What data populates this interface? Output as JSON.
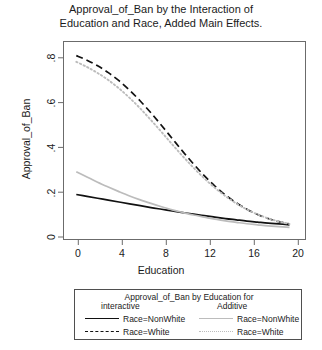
{
  "chart_data": {
    "type": "line",
    "title": "Approval_of_Ban by the Interaction of Education and Race, Added Main Effects.",
    "title_lines": [
      "Approval_of_Ban by the Interaction of",
      "Education and Race, Added Main Effects."
    ],
    "xlabel": "Education",
    "ylabel": "Approval_of_Ban",
    "xlim": [
      -1.2,
      21.5
    ],
    "ylim": [
      -0.035,
      0.92
    ],
    "xticks": [
      0,
      4,
      8,
      12,
      16,
      20
    ],
    "xtick_labels": [
      "0",
      "4",
      "8",
      "12",
      "16",
      "20"
    ],
    "yticks": [
      0,
      0.2,
      0.4,
      0.6,
      0.8
    ],
    "ytick_labels": [
      "0",
      ".2",
      ".4",
      ".6",
      ".8"
    ],
    "grid": false,
    "legend_position": "below-plot",
    "x": [
      0,
      1,
      2,
      3,
      4,
      5,
      6,
      7,
      8,
      9,
      10,
      11,
      12,
      13,
      14,
      15,
      16,
      17,
      18,
      19,
      20
    ],
    "series": [
      {
        "name": "Race=NonWhite",
        "group": "interactive",
        "style": "solid",
        "color": "#111111",
        "values": [
          0.182,
          0.173,
          0.164,
          0.155,
          0.146,
          0.137,
          0.128,
          0.119,
          0.111,
          0.103,
          0.095,
          0.087,
          0.08,
          0.073,
          0.066,
          0.06,
          0.054,
          0.049,
          0.044,
          0.04,
          0.036
        ]
      },
      {
        "name": "Race=White",
        "group": "interactive",
        "style": "dashed",
        "color": "#111111",
        "values": [
          0.852,
          0.83,
          0.803,
          0.77,
          0.731,
          0.685,
          0.633,
          0.576,
          0.515,
          0.452,
          0.389,
          0.329,
          0.273,
          0.223,
          0.179,
          0.142,
          0.111,
          0.086,
          0.066,
          0.051,
          0.04
        ]
      },
      {
        "name": "Race=NonWhite",
        "group": "Additive",
        "style": "solid",
        "color": "#bcbcbc",
        "values": [
          0.292,
          0.266,
          0.241,
          0.218,
          0.196,
          0.175,
          0.156,
          0.139,
          0.123,
          0.108,
          0.095,
          0.083,
          0.073,
          0.063,
          0.055,
          0.048,
          0.041,
          0.036,
          0.031,
          0.027,
          0.023
        ]
      },
      {
        "name": "Race=White",
        "group": "Additive",
        "style": "dotted",
        "color": "#bcbcbc",
        "values": [
          0.822,
          0.797,
          0.768,
          0.734,
          0.694,
          0.648,
          0.597,
          0.541,
          0.483,
          0.424,
          0.366,
          0.311,
          0.26,
          0.214,
          0.174,
          0.139,
          0.11,
          0.086,
          0.067,
          0.052,
          0.04
        ]
      }
    ]
  },
  "legend": {
    "title": "Approval_of_Ban by Education for",
    "group_left": "interactive",
    "group_right": "Additive",
    "entries_left": [
      {
        "label": "Race=NonWhite",
        "style": "solid-black"
      },
      {
        "label": "Race=White",
        "style": "dashed-black"
      }
    ],
    "entries_right": [
      {
        "label": "Race=NonWhite",
        "style": "solid-gray"
      },
      {
        "label": "Race=White",
        "style": "dotted-gray"
      }
    ]
  },
  "colors": {
    "interactive": "#111111",
    "additive": "#bcbcbc",
    "frame": "#6b6b6b",
    "text": "#1b1b1b"
  }
}
